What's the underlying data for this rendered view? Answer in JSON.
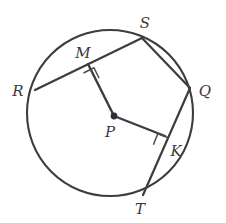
{
  "figure": {
    "type": "geometry-diagram",
    "colors": {
      "stroke": "#3c3c41",
      "label": "#3a3a3f",
      "background": "#ffffff",
      "center_dot": "#2e2e33"
    },
    "circle": {
      "center_label": "P",
      "center_x": 110,
      "center_y": 113,
      "radius": 83
    },
    "points": [
      {
        "id": "S",
        "label": "S",
        "x": 142,
        "y": 38,
        "label_x": 145,
        "label_y": 24,
        "on_circle": true
      },
      {
        "id": "M",
        "label": "M",
        "x": 88,
        "y": 64,
        "label_x": 83,
        "label_y": 54,
        "on_circle": false
      },
      {
        "id": "R",
        "label": "R",
        "x": 35,
        "y": 90,
        "label_x": 18,
        "label_y": 92,
        "on_circle": true
      },
      {
        "id": "Q",
        "label": "Q",
        "x": 190,
        "y": 88,
        "label_x": 205,
        "label_y": 92,
        "on_circle": true
      },
      {
        "id": "P",
        "label": "P",
        "x": 114,
        "y": 116,
        "label_x": 110,
        "label_y": 133,
        "on_circle": false
      },
      {
        "id": "K",
        "label": "K",
        "x": 165,
        "y": 136,
        "label_x": 176,
        "label_y": 152,
        "on_circle": false
      },
      {
        "id": "T",
        "label": "T",
        "x": 143,
        "y": 195,
        "label_x": 140,
        "label_y": 210,
        "on_circle": true
      }
    ],
    "chords": [
      {
        "id": "RS",
        "from": "R",
        "to": "S",
        "x1": 35,
        "y1": 90,
        "x2": 142,
        "y2": 38
      },
      {
        "id": "SQ",
        "from": "S",
        "to": "Q",
        "x1": 142,
        "y1": 38,
        "x2": 190,
        "y2": 88
      },
      {
        "id": "QT",
        "from": "Q",
        "to": "T",
        "x1": 190,
        "y1": 88,
        "x2": 143,
        "y2": 195
      }
    ],
    "radii": [
      {
        "id": "PM",
        "from": "P",
        "to": "M",
        "x1": 114,
        "y1": 116,
        "x2": 88,
        "y2": 64
      },
      {
        "id": "PK",
        "from": "P",
        "to": "K",
        "x1": 114,
        "y1": 116,
        "x2": 165,
        "y2": 136
      }
    ],
    "right_angles": [
      {
        "id": "angle-at-M",
        "at": "M",
        "marker": "square",
        "size": 12
      },
      {
        "id": "angle-at-K",
        "at": "K",
        "marker": "square",
        "size": 12
      }
    ]
  }
}
